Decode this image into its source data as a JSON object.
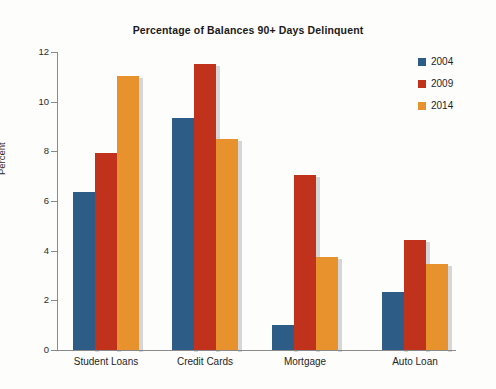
{
  "chart_data": {
    "type": "bar",
    "title": "Percentage of Balances 90+ Days Delinquent",
    "xlabel": "",
    "ylabel": "Percent",
    "ylim": [
      0,
      12
    ],
    "yticks": [
      "0",
      "2",
      "4",
      "6",
      "8",
      "10",
      "12"
    ],
    "ytick_values": [
      0,
      2,
      4,
      6,
      8,
      10,
      12
    ],
    "grid": false,
    "legend_position": "right-top",
    "categories": [
      "Student Loans",
      "Credit Cards",
      "Mortgage",
      "Auto Loan"
    ],
    "series": [
      {
        "name": "2004",
        "color": "#2d5c86",
        "values": [
          6.35,
          9.35,
          1.0,
          2.35
        ]
      },
      {
        "name": "2009",
        "color": "#c0321c",
        "values": [
          7.95,
          11.5,
          7.05,
          4.45
        ]
      },
      {
        "name": "2014",
        "color": "#e8922e",
        "values": [
          11.05,
          8.5,
          3.75,
          3.45
        ]
      }
    ]
  },
  "legend": {
    "items": [
      {
        "label": "2004",
        "color": "#2d5c86"
      },
      {
        "label": "2009",
        "color": "#c0321c"
      },
      {
        "label": "2014",
        "color": "#e8922e"
      }
    ]
  }
}
